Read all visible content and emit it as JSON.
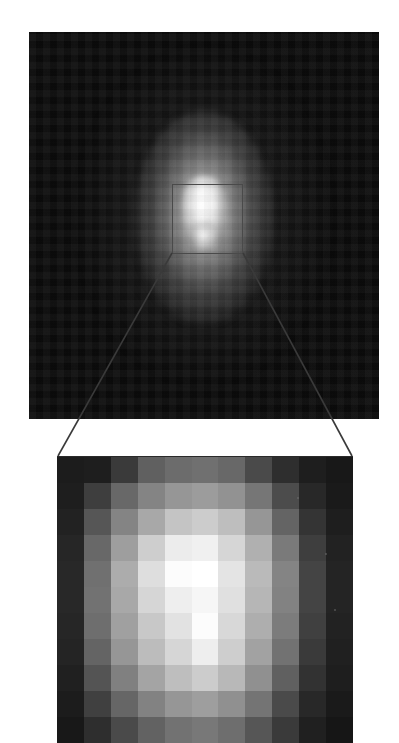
{
  "figure": {
    "background_color": "#ffffff"
  },
  "top_panel": {
    "name": "full-field-image",
    "x": 29,
    "y": 32,
    "width": 350,
    "height": 387,
    "background_color": "#050505",
    "source_center_x": 204,
    "source_center_y": 216,
    "halo_shape": "vertically-elongated-ellipse",
    "peak_color": "#ffffff",
    "inset_box": {
      "label": "inset-region",
      "x": 172,
      "y": 184,
      "width": 71,
      "height": 70,
      "stroke_color": "#4a4a4a",
      "stroke_width": 1.6
    }
  },
  "connectors": {
    "name": "zoom-indicator-lines",
    "stroke_color": "#3a3a3a",
    "stroke_width": 1.6,
    "left_line": {
      "x1": 172,
      "y1": 253,
      "x2": 58,
      "y2": 456
    },
    "right_line": {
      "x1": 243,
      "y1": 253,
      "x2": 352,
      "y2": 456
    }
  },
  "bottom_panel": {
    "name": "magnified-pixel-view",
    "x": 57,
    "y": 456,
    "width": 296,
    "height": 286,
    "background_color": "#101010",
    "grid_columns": 11,
    "grid_rows": 11,
    "cell_width": 26.9,
    "cell_height": 26.0,
    "value_range": [
      0,
      255
    ],
    "colormap": "grayscale",
    "pixel_values": [
      [
        28,
        30,
        58,
        96,
        108,
        112,
        104,
        74,
        46,
        30,
        24
      ],
      [
        30,
        62,
        104,
        132,
        150,
        156,
        146,
        118,
        76,
        40,
        26
      ],
      [
        34,
        86,
        132,
        168,
        196,
        204,
        190,
        150,
        100,
        52,
        30
      ],
      [
        38,
        104,
        158,
        206,
        236,
        240,
        214,
        176,
        122,
        62,
        34
      ],
      [
        40,
        112,
        172,
        222,
        252,
        255,
        228,
        186,
        132,
        68,
        36
      ],
      [
        40,
        114,
        168,
        214,
        238,
        246,
        224,
        182,
        130,
        68,
        36
      ],
      [
        38,
        110,
        160,
        200,
        226,
        252,
        216,
        174,
        124,
        64,
        34
      ],
      [
        36,
        100,
        150,
        188,
        214,
        238,
        206,
        162,
        114,
        58,
        32
      ],
      [
        32,
        84,
        128,
        164,
        190,
        204,
        184,
        144,
        96,
        50,
        30
      ],
      [
        28,
        64,
        102,
        130,
        150,
        158,
        144,
        116,
        74,
        40,
        26
      ],
      [
        24,
        46,
        74,
        98,
        114,
        120,
        110,
        86,
        58,
        32,
        22
      ]
    ],
    "specks": [
      {
        "x": 268,
        "y": 96,
        "size": 2
      },
      {
        "x": 277,
        "y": 152,
        "size": 2
      },
      {
        "x": 240,
        "y": 40,
        "size": 2
      }
    ]
  }
}
